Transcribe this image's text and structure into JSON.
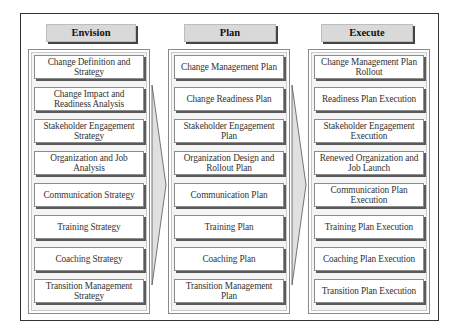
{
  "diagram": {
    "columns": [
      {
        "title": "Envision",
        "items": [
          "Change Definition and Strategy",
          "Change Impact and Readiness Analysis",
          "Stakeholder Engagement Strategy",
          "Organization and Job Analysis",
          "Communication Strategy",
          "Training Strategy",
          "Coaching Strategy",
          "Transition Management Strategy"
        ]
      },
      {
        "title": "Plan",
        "items": [
          "Change Management Plan",
          "Change Readiness Plan",
          "Stakeholder Engagement Plan",
          "Organization Design and Rollout Plan",
          "Communication Plan",
          "Training Plan",
          "Coaching Plan",
          "Transition Management Plan"
        ]
      },
      {
        "title": "Execute",
        "items": [
          "Change Management Plan Rollout",
          "Readiness Plan Execution",
          "Stakeholder Engagement Execution",
          "Renewed Organization and Job Launch",
          "Communication Plan Execution",
          "Training Plan Execution",
          "Coaching Plan Execution",
          "Transition Plan Execution"
        ]
      }
    ],
    "connectors": [
      {
        "from": "Envision",
        "to": "Plan",
        "shape": "arrow-right"
      },
      {
        "from": "Plan",
        "to": "Execute",
        "shape": "arrow-right"
      }
    ],
    "colors": {
      "header_fill": "#d9d9d9",
      "panel_fill": "#f4f4f4",
      "card_fill": "#ffffff",
      "shadow": "#5a5a5a",
      "arrow_fill": "#e0e0e0"
    }
  }
}
